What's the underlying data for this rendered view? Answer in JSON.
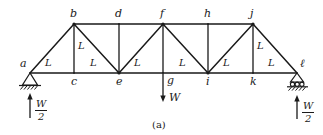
{
  "figure": {
    "caption": "(a)",
    "kind": "pin-jointed plane truss, simply supported, single central load"
  },
  "nodes": {
    "bottom_chord": [
      {
        "id": "a",
        "label": "a",
        "x": 30,
        "y": 73
      },
      {
        "id": "c",
        "label": "c",
        "x": 74,
        "y": 73
      },
      {
        "id": "e",
        "label": "e",
        "x": 119,
        "y": 73
      },
      {
        "id": "g",
        "label": "g",
        "x": 163,
        "y": 73
      },
      {
        "id": "i",
        "label": "i",
        "x": 208,
        "y": 73
      },
      {
        "id": "k",
        "label": "k",
        "x": 253,
        "y": 73
      },
      {
        "id": "l",
        "label": "ℓ",
        "x": 297,
        "y": 73
      }
    ],
    "top_chord": [
      {
        "id": "b",
        "label": "b",
        "x": 74,
        "y": 24
      },
      {
        "id": "d",
        "label": "d",
        "x": 119,
        "y": 24
      },
      {
        "id": "f",
        "label": "f",
        "x": 163,
        "y": 24
      },
      {
        "id": "h",
        "label": "h",
        "x": 208,
        "y": 24
      },
      {
        "id": "j",
        "label": "j",
        "x": 253,
        "y": 24
      }
    ]
  },
  "members": {
    "bottom_chord": [
      {
        "from": "a",
        "to": "c"
      },
      {
        "from": "c",
        "to": "e"
      },
      {
        "from": "e",
        "to": "g"
      },
      {
        "from": "g",
        "to": "i"
      },
      {
        "from": "i",
        "to": "k"
      },
      {
        "from": "k",
        "to": "l"
      }
    ],
    "top_chord": [
      {
        "from": "b",
        "to": "d"
      },
      {
        "from": "d",
        "to": "f"
      },
      {
        "from": "f",
        "to": "h"
      },
      {
        "from": "h",
        "to": "j"
      }
    ],
    "verticals": [
      {
        "from": "b",
        "to": "c"
      },
      {
        "from": "d",
        "to": "e"
      },
      {
        "from": "f",
        "to": "g"
      },
      {
        "from": "h",
        "to": "i"
      },
      {
        "from": "j",
        "to": "k"
      }
    ],
    "diagonals": [
      {
        "from": "a",
        "to": "b"
      },
      {
        "from": "b",
        "to": "e"
      },
      {
        "from": "e",
        "to": "f"
      },
      {
        "from": "f",
        "to": "i"
      },
      {
        "from": "i",
        "to": "j"
      },
      {
        "from": "j",
        "to": "l"
      }
    ]
  },
  "length_labels": {
    "text": "L",
    "bottom": [
      {
        "text": "L",
        "x": 48,
        "y": 61
      },
      {
        "text": "L",
        "x": 93,
        "y": 61
      },
      {
        "text": "L",
        "x": 137,
        "y": 61
      },
      {
        "text": "L",
        "x": 182,
        "y": 61
      },
      {
        "text": "L",
        "x": 226,
        "y": 61
      },
      {
        "text": "L",
        "x": 271,
        "y": 61
      }
    ],
    "verticals": [
      {
        "text": "L",
        "x": 79,
        "y": 45
      },
      {
        "text": "L",
        "x": 258,
        "y": 45
      }
    ]
  },
  "loads": {
    "applied": {
      "symbol": "W",
      "at_node": "g",
      "direction": "down",
      "label_x": 170,
      "label_y": 95
    },
    "reactions": [
      {
        "at_node": "a",
        "numerator": "W",
        "denominator": "2",
        "direction": "up",
        "label_x": 37,
        "label_y": 104
      },
      {
        "at_node": "ℓ",
        "numerator": "W",
        "denominator": "2",
        "direction": "up",
        "label_x": 305,
        "label_y": 104
      }
    ]
  },
  "supports": {
    "left": {
      "type": "pin-support",
      "at_node": "a",
      "x": 30,
      "y": 73
    },
    "right": {
      "type": "roller-support",
      "at_node": "ℓ",
      "x": 297,
      "y": 73
    }
  },
  "colors": {
    "ink": "#1a1a1a",
    "background": "#ffffff"
  }
}
